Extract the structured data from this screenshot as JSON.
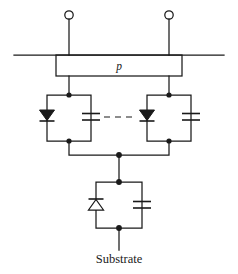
{
  "figure": {
    "kind": "circuit-schematic",
    "title_text": "",
    "background_color": "#ffffff",
    "line_color": "#1a1a1a",
    "width_px": 238,
    "height_px": 274
  },
  "labels": {
    "region_p": "p",
    "substrate": "Substrate"
  },
  "terminals": {
    "left_terminal_name": "open-terminal-left",
    "right_terminal_name": "open-terminal-right",
    "bottom_terminal_name": "substrate-terminal"
  },
  "components": {
    "branch_left": {
      "diode": "diode-filled-down",
      "capacitor": "capacitor-plates"
    },
    "branch_right": {
      "diode": "diode-filled-down",
      "capacitor": "capacitor-plates"
    },
    "branch_substrate": {
      "diode": "diode-hollow-up",
      "capacitor": "capacitor-plates"
    },
    "continuation": "dashed-ellipsis-link"
  },
  "geometry": {
    "top_rail_y": 55,
    "top_rail_x1": 14,
    "top_rail_x2": 224,
    "p_box": {
      "x": 56,
      "y": 55,
      "w": 126,
      "h": 21
    },
    "left_branch_x": 69,
    "right_branch_x": 169,
    "branch_box_top_y": 95,
    "branch_box_bottom_y": 141,
    "branch_half_width": 22,
    "merge_y": 155,
    "center_x": 119,
    "sub_box": {
      "x": 96,
      "y": 182,
      "w": 46,
      "h": 46
    },
    "substrate_lead_y2": 250
  }
}
